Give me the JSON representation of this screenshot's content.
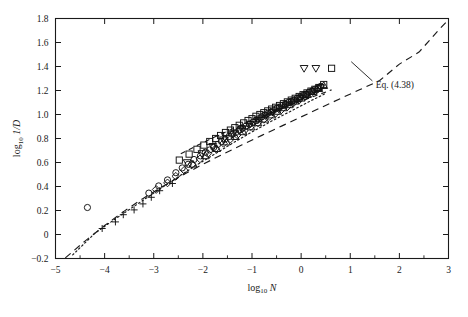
{
  "figure": {
    "name": "drag-coefficient-scatter-plot",
    "background_color": "#ffffff",
    "line_color": "#1a1a1a"
  },
  "chart_data": {
    "type": "scatter",
    "title": "",
    "xlabel": "log10 N",
    "xlabel_parts": {
      "base": "log",
      "sub": "10",
      "var": "N"
    },
    "ylabel": "log10 1/D",
    "ylabel_parts": {
      "base": "log",
      "sub": "10",
      "var": "1/D"
    },
    "xlim": [
      -5,
      3
    ],
    "ylim": [
      -0.2,
      1.8
    ],
    "xticks": [
      -5,
      -4,
      -3,
      -2,
      -1,
      0,
      1,
      2,
      3
    ],
    "xticklabels": [
      "-5",
      "-4",
      "-3",
      "-2",
      "-1",
      "0",
      "1",
      "2",
      "3"
    ],
    "yticks": [
      -0.2,
      0,
      0.2,
      0.4,
      0.6,
      0.8,
      1.0,
      1.2,
      1.4,
      1.6,
      1.8
    ],
    "yticklabels": [
      "-0.2",
      "0",
      "0.2",
      "0.4",
      "0.6",
      "0.8",
      "1.0",
      "1.2",
      "1.4",
      "1.6",
      "1.8"
    ],
    "grid": false,
    "legend": "none",
    "annotations": [
      {
        "name": "eq-annotation",
        "text": "Eq. (4.38)",
        "x": 1.52,
        "y": 1.22,
        "leader_from": [
          1.45,
          1.28
        ],
        "leader_to": [
          1.02,
          1.44
        ]
      }
    ],
    "series": [
      {
        "name": "eq-4-38-line",
        "marker": "none",
        "linestyle": "dashed",
        "comment": "Eq. (4.38) long-dashed curve spanning full range",
        "x": [
          -4.8,
          -4.4,
          -4.0,
          -3.6,
          -3.2,
          -2.8,
          -2.4,
          -2.0,
          -1.6,
          -1.2,
          -0.8,
          -0.4,
          0.0,
          0.4,
          0.8,
          1.2,
          1.6,
          2.0,
          2.4,
          2.8,
          3.0
        ],
        "y": [
          -0.195,
          -0.055,
          0.075,
          0.195,
          0.305,
          0.405,
          0.498,
          0.585,
          0.668,
          0.748,
          0.826,
          0.903,
          0.98,
          1.057,
          1.133,
          1.208,
          1.283,
          1.42,
          1.52,
          1.705,
          1.79
        ]
      },
      {
        "name": "dotted-curve",
        "marker": "none",
        "linestyle": "dotted",
        "comment": "dotted empirical curve through low-N points",
        "x": [
          -4.65,
          -4.2,
          -3.8,
          -3.4,
          -3.0,
          -2.6,
          -2.2,
          -1.8,
          -1.4,
          -1.0,
          -0.6,
          -0.2,
          0.2,
          0.5
        ],
        "y": [
          -0.17,
          0.01,
          0.125,
          0.235,
          0.345,
          0.455,
          0.56,
          0.66,
          0.76,
          0.855,
          0.945,
          1.03,
          1.115,
          1.175
        ]
      },
      {
        "name": "short-dash-curve",
        "marker": "none",
        "linestyle": "short-dash",
        "comment": "short-dashed branch through mid cluster",
        "x": [
          -2.45,
          -2.1,
          -1.75,
          -1.4,
          -1.05,
          -0.7,
          -0.35,
          0.0,
          0.35,
          0.62
        ],
        "y": [
          0.672,
          0.745,
          0.815,
          0.88,
          0.942,
          1.0,
          1.058,
          1.112,
          1.165,
          1.205
        ]
      },
      {
        "name": "plus-markers",
        "marker": "plus",
        "linestyle": "none",
        "x": [
          -4.05,
          -3.78,
          -3.62,
          -3.4,
          -3.22,
          -3.05,
          -2.88,
          -2.62
        ],
        "y": [
          0.05,
          0.105,
          0.165,
          0.205,
          0.255,
          0.31,
          0.365,
          0.425
        ]
      },
      {
        "name": "circle-markers",
        "marker": "circle",
        "linestyle": "none",
        "x": [
          -4.35,
          -3.1,
          -2.9,
          -2.72,
          -2.55,
          -2.42,
          -2.3,
          -2.18,
          -2.05,
          -1.95,
          -1.86,
          -1.78,
          -1.7,
          -1.62,
          -1.55,
          -1.47,
          -1.4,
          -1.33,
          -1.26,
          -1.19,
          -1.12,
          -1.05,
          -0.98,
          -0.92,
          -0.86,
          -0.8,
          -0.74,
          -0.68,
          -0.62,
          -0.56,
          -0.5,
          -0.44,
          -0.38,
          -0.32,
          -0.26,
          -0.2,
          -0.14,
          -0.08,
          -0.02,
          0.04,
          0.1,
          0.16,
          0.22,
          0.28,
          0.34,
          0.4
        ],
        "y": [
          0.225,
          0.345,
          0.405,
          0.455,
          0.515,
          0.555,
          0.585,
          0.625,
          0.655,
          0.685,
          0.705,
          0.725,
          0.75,
          0.775,
          0.795,
          0.815,
          0.835,
          0.85,
          0.87,
          0.885,
          0.905,
          0.92,
          0.935,
          0.95,
          0.965,
          0.98,
          0.995,
          1.01,
          1.02,
          1.035,
          1.05,
          1.06,
          1.075,
          1.085,
          1.1,
          1.11,
          1.12,
          1.135,
          1.145,
          1.16,
          1.17,
          1.185,
          1.195,
          1.21,
          1.22,
          1.235
        ]
      },
      {
        "name": "square-markers",
        "marker": "square",
        "linestyle": "none",
        "x": [
          -2.48,
          -2.28,
          -2.12,
          -1.98,
          -1.86,
          -1.74,
          -1.64,
          -1.54,
          -1.44,
          -1.35,
          -1.26,
          -1.17,
          -1.08,
          -1.0,
          -0.92,
          -0.84,
          -0.76,
          -0.68,
          -0.6,
          -0.52,
          -0.44,
          -0.36,
          -0.28,
          -0.2,
          -0.12,
          -0.04,
          0.04,
          0.12,
          0.2,
          0.28,
          0.36,
          0.46
        ],
        "y": [
          0.62,
          0.67,
          0.71,
          0.745,
          0.775,
          0.8,
          0.825,
          0.85,
          0.87,
          0.89,
          0.91,
          0.93,
          0.95,
          0.965,
          0.985,
          1.0,
          1.015,
          1.03,
          1.045,
          1.06,
          1.075,
          1.09,
          1.105,
          1.12,
          1.135,
          1.15,
          1.165,
          1.18,
          1.195,
          1.21,
          1.225,
          1.25
        ]
      },
      {
        "name": "triangle-markers",
        "marker": "triangle",
        "linestyle": "none",
        "x": [
          -2.2,
          -1.95,
          -1.72,
          -1.52,
          -1.34,
          -1.18,
          -1.02,
          -0.88,
          -0.74,
          -0.6,
          -0.48,
          -0.36,
          -0.24,
          -0.12,
          0.0,
          0.12,
          0.24,
          0.36,
          0.46
        ],
        "y": [
          0.585,
          0.655,
          0.715,
          0.77,
          0.815,
          0.855,
          0.895,
          0.93,
          0.96,
          0.995,
          1.025,
          1.055,
          1.08,
          1.11,
          1.135,
          1.165,
          1.19,
          1.215,
          1.24
        ]
      },
      {
        "name": "inverted-triangle-markers",
        "marker": "inverted-triangle",
        "linestyle": "none",
        "x": [
          -2.32,
          -2.02,
          -1.8,
          -1.58,
          -1.38,
          -1.2,
          -1.04,
          -0.88,
          -0.72,
          -0.58,
          -0.44,
          -0.3,
          -0.16,
          -0.02,
          0.12,
          0.26,
          0.4,
          0.06
        ],
        "y": [
          0.6,
          0.675,
          0.735,
          0.79,
          0.84,
          0.88,
          0.92,
          0.955,
          0.99,
          1.02,
          1.05,
          1.08,
          1.105,
          1.135,
          1.165,
          1.195,
          1.225,
          1.385
        ]
      },
      {
        "name": "diamond-markers",
        "marker": "diamond",
        "linestyle": "none",
        "x": [
          -2.95,
          -2.72,
          -2.55,
          -2.38,
          -2.22,
          -2.06,
          -1.9,
          -1.74,
          -1.58,
          -1.44,
          -1.3,
          -1.16,
          -1.02,
          -0.88,
          -0.76,
          -0.64,
          -0.52,
          -0.4,
          -0.28,
          -0.16,
          -0.04,
          0.08,
          0.2,
          0.32
        ],
        "y": [
          0.375,
          0.43,
          0.485,
          0.535,
          0.585,
          0.63,
          0.675,
          0.715,
          0.76,
          0.795,
          0.83,
          0.865,
          0.9,
          0.93,
          0.96,
          0.985,
          1.01,
          1.04,
          1.065,
          1.095,
          1.12,
          1.15,
          1.175,
          1.205
        ]
      },
      {
        "name": "outlier-markers",
        "marker": "mixed-outliers",
        "linestyle": "none",
        "comment": "isolated points above main cluster near log10 N = 0.3",
        "x": [
          0.3,
          0.62
        ],
        "y": [
          1.385,
          1.385
        ]
      }
    ]
  }
}
